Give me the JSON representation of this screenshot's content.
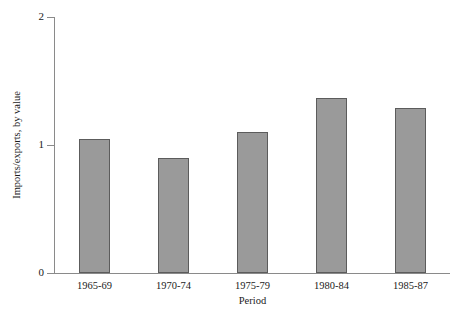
{
  "chart_data": {
    "type": "bar",
    "title": "",
    "subtitle": "",
    "xlabel": "Period",
    "ylabel": "Imports/exports, by value",
    "categories": [
      "1965-69",
      "1970-74",
      "1975-79",
      "1980-84",
      "1985-87"
    ],
    "values": [
      1.05,
      0.9,
      1.1,
      1.37,
      1.29
    ],
    "series": [
      {
        "name": "Imports/exports, by value",
        "values": [
          1.05,
          0.9,
          1.1,
          1.37,
          1.29
        ]
      }
    ],
    "ylim": [
      0,
      2
    ],
    "xlim": [
      0,
      5
    ],
    "y_ticks": [
      "0",
      "1",
      "2"
    ],
    "y_tick_values": [
      0,
      1,
      2
    ],
    "grid": false,
    "legend": false,
    "legend_position": "none",
    "bar_color": "#9a9a9a",
    "bar_edge_color": "#5c5c5c",
    "axis_color": "#8a8a8a",
    "background_color": "#ffffff",
    "annotations": []
  }
}
